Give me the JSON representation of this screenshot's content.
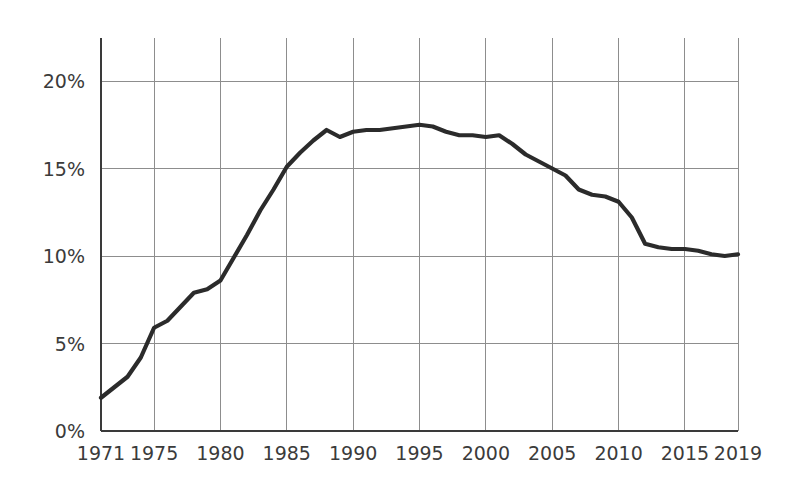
{
  "chart_data": {
    "type": "line",
    "title": "",
    "subtitle": "",
    "xlabel": "",
    "ylabel": "",
    "xlim": [
      1971,
      2019
    ],
    "ylim": [
      0,
      22.5
    ],
    "grid": true,
    "legend": null,
    "y_tick_labels": [
      "0%",
      "5%",
      "10%",
      "15%",
      "20%"
    ],
    "y_tick_values": [
      0,
      5,
      10,
      15,
      20
    ],
    "x_tick_labels": [
      "1971",
      "1975",
      "1980",
      "1985",
      "1990",
      "1995",
      "2000",
      "2005",
      "2010",
      "2015",
      "2019"
    ],
    "x_tick_values": [
      1971,
      1975,
      1980,
      1985,
      1990,
      1995,
      2000,
      2005,
      2010,
      2015,
      2019
    ],
    "value_suffix": "%",
    "line_color": "#2b2b2b",
    "grid_color": "#8d8d8d",
    "axis_color": "#3a3a3a",
    "background_color": "#ffffff",
    "series": [
      {
        "name": "series-1",
        "x": [
          1971,
          1972,
          1973,
          1974,
          1975,
          1976,
          1977,
          1978,
          1979,
          1980,
          1981,
          1982,
          1983,
          1984,
          1985,
          1986,
          1987,
          1988,
          1989,
          1990,
          1991,
          1992,
          1993,
          1994,
          1995,
          1996,
          1997,
          1998,
          1999,
          2000,
          2001,
          2002,
          2003,
          2004,
          2005,
          2006,
          2007,
          2008,
          2009,
          2010,
          2011,
          2012,
          2013,
          2014,
          2015,
          2016,
          2017,
          2018,
          2019
        ],
        "values": [
          1.9,
          2.5,
          3.1,
          4.2,
          5.9,
          6.3,
          7.1,
          7.9,
          8.1,
          8.6,
          9.9,
          11.2,
          12.6,
          13.8,
          15.1,
          15.9,
          16.6,
          17.2,
          16.8,
          17.1,
          17.2,
          17.2,
          17.3,
          17.4,
          17.5,
          17.4,
          17.1,
          16.9,
          16.9,
          16.8,
          16.9,
          16.4,
          15.8,
          15.4,
          15.0,
          14.6,
          13.8,
          13.5,
          13.4,
          13.1,
          12.2,
          10.7,
          10.5,
          10.4,
          10.4,
          10.3,
          10.1,
          10.0,
          10.1
        ]
      }
    ]
  },
  "geometry": {
    "plot_left": 101,
    "plot_right": 738,
    "plot_top": 38,
    "plot_bottom": 431,
    "y_zero_px": 431,
    "y_twenty_px": 81
  }
}
